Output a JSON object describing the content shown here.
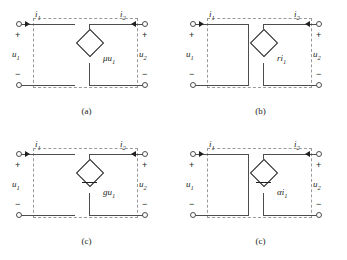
{
  "figure": {
    "colors": {
      "wire": "#4d4d4f",
      "dashed_box": "#9a9a9d",
      "text": "#231f20",
      "background": "#ffffff"
    }
  },
  "common": {
    "input_current_label": "i",
    "input_current_sub": "1",
    "output_current_label": "i",
    "output_current_sub": "2",
    "input_voltage_label": "u",
    "input_voltage_sub": "1",
    "output_voltage_label": "u",
    "output_voltage_sub": "2",
    "plus_sign": "+",
    "minus_sign": "−"
  },
  "panels": [
    {
      "id": "a",
      "caption": "(a)",
      "source_kind": "voltage-controlled-voltage-source",
      "source_symbol": "diamond",
      "source_marker": "none",
      "source_label_main": "μu",
      "source_label_sub": "1",
      "source_label_full": "μu₁",
      "left_port": "open",
      "i1": "i",
      "i1_sub": "1",
      "i2": "i",
      "i2_sub": "2",
      "u1": "u",
      "u1_sub": "1",
      "u2": "u",
      "u2_sub": "2",
      "plus_left": "+",
      "minus_left": "−",
      "plus_right": "+",
      "minus_right": "−"
    },
    {
      "id": "b",
      "caption": "(b)",
      "source_kind": "current-controlled-voltage-source",
      "source_symbol": "diamond",
      "source_marker": "none",
      "source_label_main": "ri",
      "source_label_sub": "1",
      "source_label_full": "ri₁",
      "left_port": "short",
      "i1": "i",
      "i1_sub": "1",
      "i2": "i",
      "i2_sub": "2",
      "u1": "u",
      "u1_sub": "1",
      "u2": "u",
      "u2_sub": "2",
      "plus_left": "+",
      "minus_left": "−",
      "plus_right": "+",
      "minus_right": "−"
    },
    {
      "id": "c",
      "caption": "(c)",
      "source_kind": "voltage-controlled-current-source",
      "source_symbol": "diamond",
      "source_marker": "horizontal-bar",
      "source_label_main": "gu",
      "source_label_sub": "1",
      "source_label_full": "gu₁",
      "left_port": "open",
      "i1": "i",
      "i1_sub": "1",
      "i2": "i",
      "i2_sub": "2",
      "u1": "u",
      "u1_sub": "1",
      "u2": "u",
      "u2_sub": "2",
      "plus_left": "+",
      "minus_left": "−",
      "plus_right": "+",
      "minus_right": "−"
    },
    {
      "id": "d",
      "caption": "(c)",
      "source_kind": "current-controlled-current-source",
      "source_symbol": "diamond",
      "source_marker": "horizontal-bar",
      "source_label_main": "αi",
      "source_label_sub": "1",
      "source_label_full": "αi₁",
      "left_port": "short",
      "i1": "i",
      "i1_sub": "1",
      "i2": "i",
      "i2_sub": "2",
      "u1": "u",
      "u1_sub": "1",
      "u2": "u",
      "u2_sub": "2",
      "plus_left": "+",
      "minus_left": "−",
      "plus_right": "+",
      "minus_right": "−"
    }
  ]
}
